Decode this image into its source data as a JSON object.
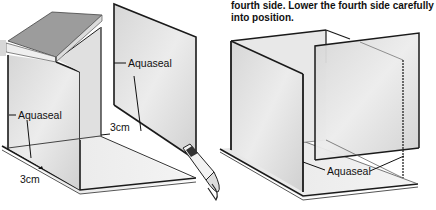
{
  "caption": {
    "line1": "fourth side. Lower the fourth side carefully",
    "line2": "into position."
  },
  "left_figure": {
    "labels": {
      "aquaseal_panel": "Aquaseal",
      "aquaseal_side": "Aquaseal",
      "gap_back": "3cm",
      "gap_front": "3cm"
    },
    "objects": [
      "book",
      "glass-side-panel",
      "glass-free-panel",
      "glass-base",
      "sealant-tube"
    ]
  },
  "right_figure": {
    "labels": {
      "aquaseal_base": "Aquaseal"
    },
    "objects": [
      "glass-back-panel",
      "glass-side-panel",
      "glass-front-panel",
      "glass-base"
    ]
  },
  "colors": {
    "line": "#1a1a1a",
    "glass_fill": "#e4e4e4",
    "glass_shade": "#d2d2d2",
    "book_cover": "#9a9a9a",
    "book_pages": "#efefef"
  }
}
